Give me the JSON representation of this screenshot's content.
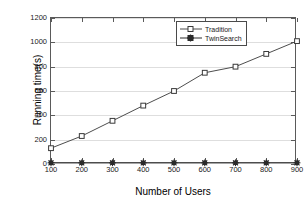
{
  "chart_data": {
    "type": "line",
    "title": "",
    "xlabel": "Number of Users",
    "ylabel": "Running time(s)",
    "x": [
      100,
      200,
      300,
      400,
      500,
      600,
      700,
      800,
      900
    ],
    "xticklabels": [
      "100",
      "200",
      "300",
      "400",
      "500",
      "600",
      "700",
      "800",
      "900"
    ],
    "yticklabels": [
      "0",
      "200",
      "400",
      "600",
      "800",
      "1000",
      "1200"
    ],
    "yticks": [
      0,
      200,
      400,
      600,
      800,
      1000,
      1200
    ],
    "xlim": [
      100,
      900
    ],
    "ylim": [
      0,
      1200
    ],
    "grid": "horizontal",
    "legend_position": "top-center-right",
    "series": [
      {
        "name": "Tradition",
        "marker": "open-square",
        "color": "#4d4d4d",
        "values": [
          130,
          230,
          355,
          480,
          600,
          750,
          800,
          905,
          1010
        ]
      },
      {
        "name": "TwinSearch",
        "marker": "filled-star-square",
        "color": "#4d4d4d",
        "values": [
          10,
          10,
          10,
          10,
          10,
          10,
          10,
          10,
          10
        ]
      }
    ]
  },
  "legend": {
    "items": [
      {
        "label": "Tradition"
      },
      {
        "label": "TwinSearch"
      }
    ]
  }
}
